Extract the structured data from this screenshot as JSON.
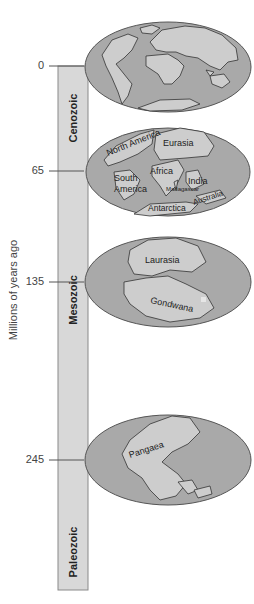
{
  "diagram": {
    "axis_title": "Millions of years ago",
    "ticks": [
      {
        "value": "0",
        "y": 66
      },
      {
        "value": "65",
        "y": 171
      },
      {
        "value": "135",
        "y": 282
      },
      {
        "value": "245",
        "y": 460
      }
    ],
    "eras": [
      {
        "name": "Cenozoic",
        "y": 118
      },
      {
        "name": "Mesozoic",
        "y": 300
      },
      {
        "name": "Paleozoic",
        "y": 552
      }
    ],
    "maps": [
      {
        "time": "0",
        "labels": []
      },
      {
        "time": "65",
        "labels": [
          "North America",
          "Eurasia",
          "Africa",
          "South America",
          "India",
          "Madagascar",
          "Australia",
          "Antarctica"
        ]
      },
      {
        "time": "135",
        "labels": [
          "Laurasia",
          "Gondwana"
        ]
      },
      {
        "time": "245",
        "labels": [
          "Pangaea"
        ]
      }
    ],
    "colors": {
      "bar_fill": "#d8d8d8",
      "bar_border": "#8a8a8a",
      "ocean": "#a9a9a9",
      "land": "#cdcdcd",
      "outline": "#333333"
    }
  },
  "map65": {
    "north_america": "North America",
    "eurasia": "Eurasia",
    "africa": "Africa",
    "south_america_1": "South",
    "south_america_2": "America",
    "india": "India",
    "madagascar": "Madagascar",
    "australia": "Australia",
    "antarctica": "Antarctica"
  },
  "map135": {
    "laurasia": "Laurasia",
    "gondwana": "Gondwana"
  },
  "map245": {
    "pangaea": "Pangaea"
  }
}
